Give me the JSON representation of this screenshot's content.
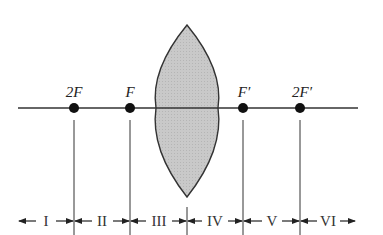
{
  "diagram": {
    "axis": {
      "x1": 18,
      "x2": 358,
      "y": 108,
      "color": "#333333"
    },
    "lens": {
      "cx": 187,
      "top": 25,
      "bottom": 197,
      "left": 156,
      "right": 218,
      "fill": "#c8c8c8",
      "stroke": "#333333"
    },
    "points": [
      {
        "id": "2F",
        "label": "2F",
        "x": 74
      },
      {
        "id": "F",
        "label": "F",
        "x": 130
      },
      {
        "id": "F-prime",
        "label": "F′",
        "x": 243
      },
      {
        "id": "2F-prime",
        "label": "2F′",
        "x": 300
      }
    ],
    "regions": [
      {
        "label": "I",
        "x1": 18,
        "x2": 74
      },
      {
        "label": "II",
        "x1": 74,
        "x2": 130
      },
      {
        "label": "III",
        "x1": 130,
        "x2": 187
      },
      {
        "label": "IV",
        "x1": 187,
        "x2": 243
      },
      {
        "label": "V",
        "x1": 243,
        "x2": 300
      },
      {
        "label": "VI",
        "x1": 300,
        "x2": 356
      }
    ]
  }
}
